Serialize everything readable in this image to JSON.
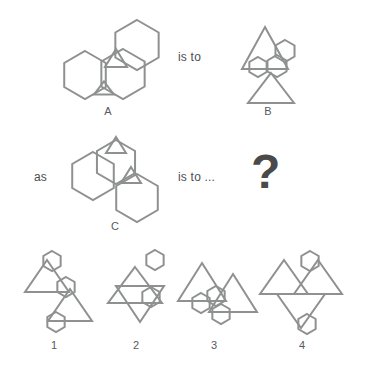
{
  "puzzle": {
    "type": "visual-analogy-matrix",
    "stroke_color": "#8f9090",
    "text_color": "#58595b",
    "background_color": "#ffffff",
    "relations": {
      "is_to": "is to",
      "as": "as",
      "is_to_ellipsis": "is to ...",
      "unknown": "?"
    },
    "prompt_figures": [
      {
        "id": "A",
        "label": "A",
        "label_x": 108,
        "label_y": 105,
        "description": "three overlapping hexagons with two small triangles at overlaps"
      },
      {
        "id": "B",
        "label": "B",
        "label_x": 268,
        "label_y": 105,
        "description": "two large triangles with three hexagons clustered between them"
      },
      {
        "id": "C",
        "label": "C",
        "label_x": 115,
        "label_y": 220,
        "description": "three overlapping hexagons with two small triangles on upper edges"
      }
    ],
    "options": [
      {
        "id": "1",
        "label": "1",
        "label_x": 54,
        "label_y": 339,
        "description": "two triangles diagonally stacked with three hexagons"
      },
      {
        "id": "2",
        "label": "2",
        "label_x": 136,
        "label_y": 339,
        "description": "two triangles point to point with two hexagons right side"
      },
      {
        "id": "3",
        "label": "3",
        "label_x": 214,
        "label_y": 339,
        "description": "two side by side triangles with two hexagons below"
      },
      {
        "id": "4",
        "label": "4",
        "label_x": 302,
        "label_y": 339,
        "description": "three triangles meeting at a center point with two hexagons"
      }
    ],
    "relation_positions": {
      "is_to_x": 178,
      "is_to_y": 50,
      "as_x": 34,
      "as_y": 170,
      "is_to_ellipsis_x": 178,
      "is_to_ellipsis_y": 170,
      "question_x": 251,
      "question_y": 148
    }
  },
  "shapes": {
    "figure_a": [
      {
        "name": "hexagon-left",
        "kind": "hexagon",
        "cx": 85,
        "cy": 75,
        "r": 24,
        "rot": 0
      },
      {
        "name": "hexagon-center",
        "kind": "hexagon",
        "cx": 123,
        "cy": 74,
        "r": 25,
        "rot": 0
      },
      {
        "name": "hexagon-upper",
        "kind": "hexagon",
        "cx": 137,
        "cy": 45,
        "r": 25,
        "rot": 0
      },
      {
        "name": "triangle-small-upper",
        "kind": "triangle-up",
        "cx": 116,
        "cy": 58,
        "w": 22,
        "h": 18
      },
      {
        "name": "triangle-small-lower",
        "kind": "triangle-up",
        "cx": 104,
        "cy": 88,
        "w": 20,
        "h": 13
      }
    ],
    "figure_b": [
      {
        "name": "triangle-top",
        "kind": "triangle-up",
        "cx": 265,
        "cy": 48,
        "w": 46,
        "h": 42
      },
      {
        "name": "triangle-bottom",
        "kind": "triangle-up",
        "cx": 271,
        "cy": 88,
        "w": 46,
        "h": 30
      },
      {
        "name": "hexagon-right",
        "kind": "hexagon",
        "cx": 285,
        "cy": 51,
        "r": 11,
        "rot": 0
      },
      {
        "name": "hexagon-mid",
        "kind": "hexagon",
        "cx": 277,
        "cy": 66,
        "r": 11,
        "rot": 0
      },
      {
        "name": "hexagon-left",
        "kind": "hexagon",
        "cx": 258,
        "cy": 67,
        "r": 10,
        "rot": 0
      }
    ],
    "figure_c": [
      {
        "name": "hexagon-left",
        "kind": "hexagon",
        "cx": 93,
        "cy": 176,
        "r": 24,
        "rot": 0
      },
      {
        "name": "hexagon-upper",
        "kind": "hexagon",
        "cx": 116,
        "cy": 162,
        "r": 22,
        "rot": 0
      },
      {
        "name": "hexagon-lower",
        "kind": "hexagon",
        "cx": 137,
        "cy": 198,
        "r": 24,
        "rot": 0
      },
      {
        "name": "triangle-small-top",
        "kind": "triangle-up",
        "cx": 116,
        "cy": 145,
        "w": 20,
        "h": 16
      },
      {
        "name": "triangle-small-mid",
        "kind": "triangle-up",
        "cx": 131,
        "cy": 175,
        "w": 20,
        "h": 16
      }
    ],
    "option_1": [
      {
        "name": "triangle-upper",
        "kind": "triangle-up",
        "cx": 47,
        "cy": 276,
        "w": 44,
        "h": 32
      },
      {
        "name": "triangle-lower",
        "kind": "triangle-up",
        "cx": 70,
        "cy": 305,
        "w": 44,
        "h": 32
      },
      {
        "name": "hexagon-top",
        "kind": "hexagon",
        "cx": 52,
        "cy": 261,
        "r": 10,
        "rot": 0
      },
      {
        "name": "hexagon-mid",
        "kind": "hexagon",
        "cx": 66,
        "cy": 287,
        "r": 10,
        "rot": 0
      },
      {
        "name": "hexagon-bottom",
        "kind": "hexagon",
        "cx": 56,
        "cy": 322,
        "r": 10,
        "rot": 0
      }
    ],
    "option_2": [
      {
        "name": "triangle-upper",
        "kind": "triangle-up",
        "cx": 135,
        "cy": 285,
        "w": 54,
        "h": 36
      },
      {
        "name": "triangle-lower",
        "kind": "triangle-down",
        "cx": 140,
        "cy": 304,
        "w": 48,
        "h": 36
      },
      {
        "name": "hexagon-top",
        "kind": "hexagon",
        "cx": 155,
        "cy": 260,
        "r": 10,
        "rot": 0
      },
      {
        "name": "hexagon-mid",
        "kind": "hexagon",
        "cx": 151,
        "cy": 297,
        "r": 10,
        "rot": 0
      }
    ],
    "option_3": [
      {
        "name": "triangle-left",
        "kind": "triangle-up",
        "cx": 202,
        "cy": 282,
        "w": 48,
        "h": 38
      },
      {
        "name": "triangle-right",
        "kind": "triangle-up",
        "cx": 233,
        "cy": 293,
        "w": 48,
        "h": 38
      },
      {
        "name": "hexagon-left",
        "kind": "hexagon",
        "cx": 201,
        "cy": 303,
        "r": 10,
        "rot": 0
      },
      {
        "name": "hexagon-mid",
        "kind": "hexagon",
        "cx": 216,
        "cy": 296,
        "r": 10,
        "rot": 0
      },
      {
        "name": "hexagon-right",
        "kind": "hexagon",
        "cx": 221,
        "cy": 314,
        "r": 10,
        "rot": 0
      }
    ],
    "option_4": [
      {
        "name": "triangle-left",
        "kind": "triangle-up",
        "cx": 284,
        "cy": 277,
        "w": 48,
        "h": 34
      },
      {
        "name": "triangle-right",
        "kind": "triangle-up",
        "cx": 318,
        "cy": 277,
        "w": 48,
        "h": 34
      },
      {
        "name": "triangle-bottom",
        "kind": "triangle-down",
        "cx": 301,
        "cy": 311,
        "w": 48,
        "h": 34
      },
      {
        "name": "hexagon-top",
        "kind": "hexagon",
        "cx": 310,
        "cy": 261,
        "r": 10,
        "rot": 0
      },
      {
        "name": "hexagon-bottom",
        "kind": "hexagon",
        "cx": 307,
        "cy": 324,
        "r": 10,
        "rot": 0
      }
    ]
  }
}
